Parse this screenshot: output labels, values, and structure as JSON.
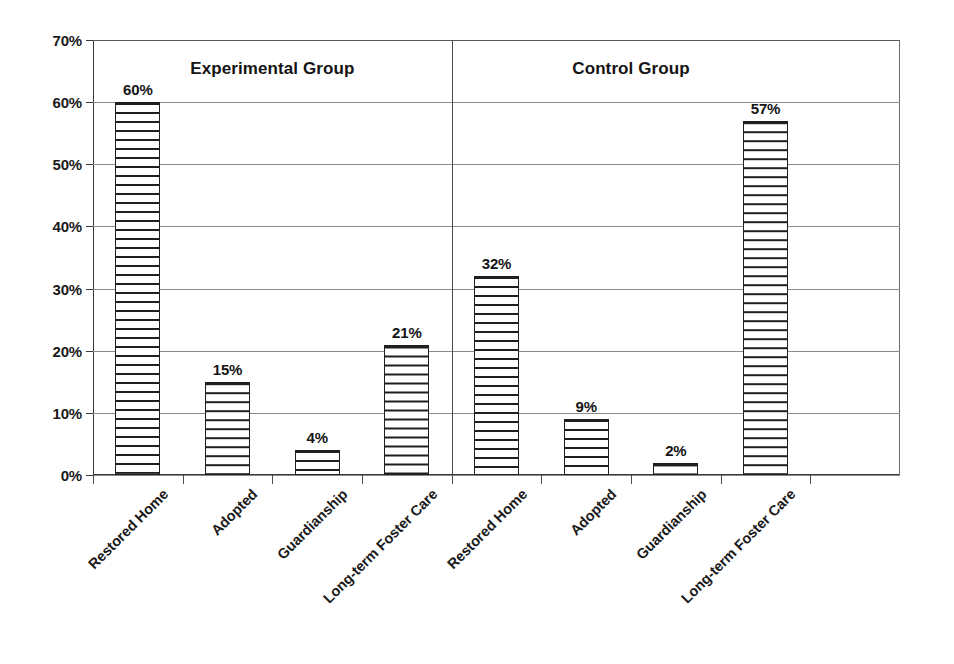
{
  "chart_data": {
    "type": "bar",
    "title": "",
    "xlabel": "",
    "ylabel": "",
    "ylim": [
      0,
      70
    ],
    "ytick_labels": [
      "0%",
      "10%",
      "20%",
      "30%",
      "40%",
      "50%",
      "60%",
      "70%"
    ],
    "ytick_values": [
      0,
      10,
      20,
      30,
      40,
      50,
      60,
      70
    ],
    "grid": true,
    "legend_position": "none",
    "categories": [
      "Restored Home",
      "Adopted",
      "Guardianship",
      "Long-term Foster Care"
    ],
    "groups": [
      {
        "name": "Experimental Group",
        "values": [
          60,
          15,
          4,
          21
        ],
        "value_labels": [
          "60%",
          "15%",
          "4%",
          "21%"
        ]
      },
      {
        "name": "Control Group",
        "values": [
          32,
          9,
          2,
          57
        ],
        "value_labels": [
          "32%",
          "9%",
          "2%",
          "57%"
        ]
      }
    ],
    "series": [
      {
        "name": "Experimental Group",
        "values": [
          60,
          15,
          4,
          21
        ]
      },
      {
        "name": "Control Group",
        "values": [
          32,
          9,
          2,
          57
        ]
      }
    ],
    "bar_fill": "horizontal-stripes",
    "colors": {
      "bar_stroke": "#1f1f1f",
      "bar_fill": "#ffffff",
      "gridline": "#8a8a8a",
      "axis": "#3a3a3a",
      "text": "#1a1a1a",
      "background": "#ffffff"
    }
  }
}
